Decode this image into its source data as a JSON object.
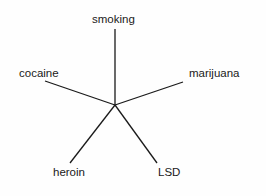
{
  "diagram": {
    "type": "star",
    "center": {
      "x": 115,
      "y": 105
    },
    "line_color": "#1a1a1a",
    "nodes": [
      {
        "label": "smoking",
        "end": {
          "x": 115,
          "y": 29
        }
      },
      {
        "label": "cocaine",
        "end": {
          "x": 45,
          "y": 81
        }
      },
      {
        "label": "marijuana",
        "end": {
          "x": 183,
          "y": 82
        }
      },
      {
        "label": "heroin",
        "end": {
          "x": 70,
          "y": 163
        }
      },
      {
        "label": "LSD",
        "end": {
          "x": 157,
          "y": 163
        }
      }
    ]
  }
}
